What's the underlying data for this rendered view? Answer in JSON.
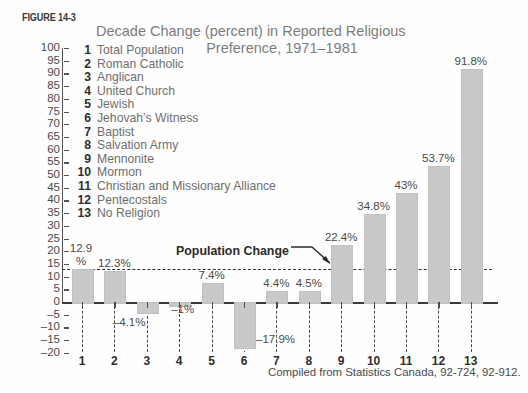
{
  "figure": {
    "number_label": "FIGURE 14-3",
    "title_line1": "Decade Change (percent) in Reported Religious",
    "title_line2": "Preference,  1971–1981",
    "source": "Compiled from Statistics Canada, 92-724, 92-912."
  },
  "annotation": {
    "population_change_label": "Population Change"
  },
  "legend": {
    "items": [
      {
        "num": "1",
        "label": "Total Population"
      },
      {
        "num": "2",
        "label": "Roman Catholic"
      },
      {
        "num": "3",
        "label": "Anglican"
      },
      {
        "num": "4",
        "label": "United Church"
      },
      {
        "num": "5",
        "label": "Jewish"
      },
      {
        "num": "6",
        "label": "Jehovah’s Witness"
      },
      {
        "num": "7",
        "label": "Baptist"
      },
      {
        "num": "8",
        "label": "Salvation Army"
      },
      {
        "num": "9",
        "label": "Mennonite"
      },
      {
        "num": "10",
        "label": "Mormon"
      },
      {
        "num": "11",
        "label": "Christian and Missionary Alliance"
      },
      {
        "num": "12",
        "label": "Pentecostals"
      },
      {
        "num": "13",
        "label": "No Religion"
      }
    ]
  },
  "colors": {
    "bar_fill": "#c9c9c9",
    "axis": "#3a3a3a",
    "title_text": "#7d7d7d",
    "body_text": "#4a4a4a",
    "background": "#fefefe"
  },
  "chart_data": {
    "type": "bar",
    "title": "Decade Change (percent) in Reported Religious Preference, 1971–1981",
    "xlabel": "",
    "ylabel": "",
    "ylim": [
      -20,
      100
    ],
    "ytick_step": 5,
    "yticks": [
      100,
      95,
      90,
      85,
      80,
      75,
      70,
      65,
      60,
      55,
      50,
      45,
      40,
      35,
      30,
      25,
      20,
      15,
      10,
      5,
      0,
      -5,
      -10,
      -15,
      -20
    ],
    "ytick_labels": [
      "100",
      "95",
      "90",
      "85",
      "80",
      "75",
      "70",
      "65",
      "60",
      "55",
      "50",
      "45",
      "40",
      "35",
      "30",
      "25",
      "20",
      "15",
      "10",
      "5",
      "0",
      "–5",
      "–10",
      "–15",
      "–20"
    ],
    "grid": false,
    "legend_position": "upper-left-inside",
    "categories": [
      "1",
      "2",
      "3",
      "4",
      "5",
      "6",
      "7",
      "8",
      "9",
      "10",
      "11",
      "12",
      "13"
    ],
    "category_names": [
      "Total Population",
      "Roman Catholic",
      "Anglican",
      "United Church",
      "Jewish",
      "Jehovah’s Witness",
      "Baptist",
      "Salvation Army",
      "Mennonite",
      "Mormon",
      "Christian and Missionary Alliance",
      "Pentecostals",
      "No Religion"
    ],
    "values": [
      12.9,
      12.3,
      -4.1,
      -1,
      7.4,
      -17.9,
      4.4,
      4.5,
      22.4,
      34.8,
      43,
      53.7,
      91.8
    ],
    "data_labels": [
      "12.9\n%",
      "12.3%",
      "–4.1%",
      "–1%",
      "7.4%",
      "–17.9%",
      "4.4%",
      "4.5%",
      "22.4%",
      "34.8%",
      "43%",
      "53.7%",
      "91.8%"
    ],
    "reference_line": {
      "value": 12.9,
      "label": "Population Change",
      "style": "dashed"
    },
    "annotations": [
      "Population Change"
    ],
    "source": "Compiled from Statistics Canada, 92-724, 92-912."
  }
}
